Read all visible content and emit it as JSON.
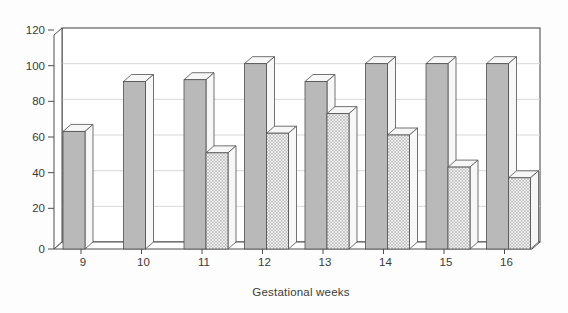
{
  "figure": {
    "background": "#fdfdfd"
  },
  "chart_data": {
    "type": "bar",
    "title": "",
    "xlabel": "Gestational weeks",
    "ylabel": "",
    "categories": [
      "9",
      "10",
      "11",
      "12",
      "13",
      "14",
      "15",
      "16"
    ],
    "series": [
      {
        "name": "solid-gray-bars",
        "pattern": "solid",
        "color": "#b9b9b9",
        "values": [
          62,
          90,
          91,
          100,
          90,
          100,
          100,
          100
        ]
      },
      {
        "name": "crosshatched-bars",
        "pattern": "crosshatch",
        "color": "#9a9a9a",
        "values": [
          null,
          null,
          50,
          61,
          72,
          60,
          42,
          36
        ]
      }
    ],
    "y_ticks": [
      "0",
      "20",
      "40",
      "60",
      "80",
      "100",
      "120"
    ],
    "ylim": [
      0,
      120
    ],
    "grid": true,
    "legend": "none",
    "style_3d": true
  },
  "colors": {
    "axis": "#4f4f4f",
    "grid": "#d8d8d8",
    "text": "#3a3a3a",
    "wall": "#ffffff",
    "face_light": "#f7f7f7",
    "hatch_line": "#9a9a9a"
  }
}
